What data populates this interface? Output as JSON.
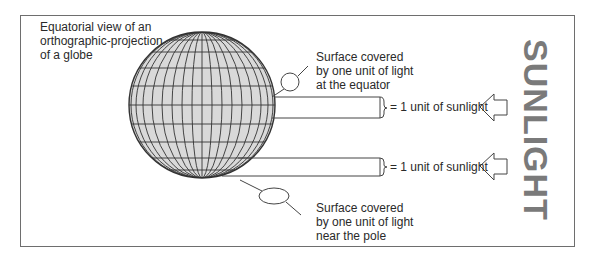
{
  "title_label": "Equatorial view of an\northographic-projection\nof a globe",
  "equator_label": "Surface covered\nby one unit of light\nat the equator",
  "pole_label": "Surface covered\nby one unit of light\nnear the pole",
  "beams": [
    {
      "label": "= 1 unit of sunlight",
      "position": "equator"
    },
    {
      "label": "= 1 unit of sunlight",
      "position": "pole"
    }
  ],
  "sunlight_label": "SUNLIGHT",
  "colors": {
    "globe_fill": "#d9d9d9",
    "lines": "#333333",
    "sunlight_text": "#7a7a7a",
    "border": "#6e6e6e"
  }
}
